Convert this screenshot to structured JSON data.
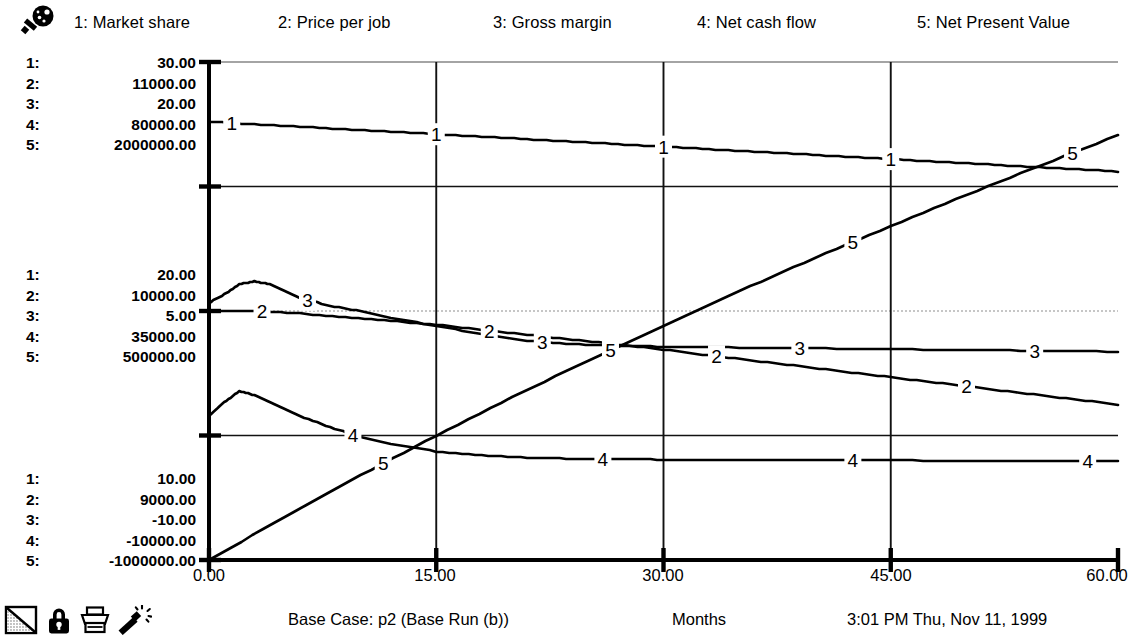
{
  "window": {
    "title": "Simulation Graph"
  },
  "toolbar": {
    "zoom_icon": "magnifier-icon"
  },
  "legend": {
    "entries": [
      {
        "index": "1",
        "label": "1: Market share"
      },
      {
        "index": "2",
        "label": "2: Price per job"
      },
      {
        "index": "3",
        "label": "3: Gross margin"
      },
      {
        "index": "4",
        "label": "4: Net cash flow"
      },
      {
        "index": "5",
        "label": "5: Net Present Value"
      }
    ]
  },
  "y_scales": {
    "top": [
      {
        "idx": "1:",
        "value": "30.00"
      },
      {
        "idx": "2:",
        "value": "11000.00"
      },
      {
        "idx": "3:",
        "value": "20.00"
      },
      {
        "idx": "4:",
        "value": "80000.00"
      },
      {
        "idx": "5:",
        "value": "2000000.00"
      }
    ],
    "middle": [
      {
        "idx": "1:",
        "value": "20.00"
      },
      {
        "idx": "2:",
        "value": "10000.00"
      },
      {
        "idx": "3:",
        "value": "5.00"
      },
      {
        "idx": "4:",
        "value": "35000.00"
      },
      {
        "idx": "5:",
        "value": "500000.00"
      }
    ],
    "bottom": [
      {
        "idx": "1:",
        "value": "10.00"
      },
      {
        "idx": "2:",
        "value": "9000.00"
      },
      {
        "idx": "3:",
        "value": "-10.00"
      },
      {
        "idx": "4:",
        "value": "-10000.00"
      },
      {
        "idx": "5:",
        "value": "-1000000.00"
      }
    ]
  },
  "x_axis": {
    "ticks": [
      "0.00",
      "15.00",
      "30.00",
      "45.00",
      "60.00"
    ],
    "title": "Months"
  },
  "footer": {
    "run_label": "Base Case: p2 (Base Run (b))",
    "x_title": "Months",
    "timestamp": "3:01 PM   Thu, Nov 11, 1999",
    "icons": [
      "page-corner-icon",
      "lock-icon",
      "printer-icon",
      "magic-wand-icon"
    ]
  },
  "chart_data": {
    "type": "line",
    "title": "",
    "subtitle": "Base Case: p2 (Base Run (b))",
    "xlabel": "Months",
    "ylabel": "",
    "xlim": [
      0,
      60
    ],
    "xticks": [
      0,
      15,
      30,
      45,
      60
    ],
    "grid": true,
    "grid_vertical_at": [
      15,
      30,
      45
    ],
    "grid_horizontal_at_fraction": [
      1.0,
      0.75,
      0.5,
      0.25,
      0.0
    ],
    "legend_position": "top",
    "note": "Five series, each drawn on its own independent y-scale. Scale max / mid / min values per series are given below; y values are in each series' own units.",
    "series": [
      {
        "name": "Market share",
        "index": 1,
        "scale": {
          "max": 30.0,
          "mid": 20.0,
          "min": 10.0
        },
        "units": "%",
        "label_marker_x": [
          1.5,
          15.0,
          30.0,
          45.0
        ],
        "x": [
          0,
          3,
          6,
          9,
          12,
          15,
          18,
          21,
          24,
          27,
          30,
          33,
          36,
          39,
          42,
          45,
          48,
          51,
          54,
          57,
          60
        ],
        "y": [
          27.6,
          27.5,
          27.4,
          27.3,
          27.2,
          27.1,
          27.0,
          26.9,
          26.8,
          26.7,
          26.6,
          26.5,
          26.4,
          26.3,
          26.2,
          26.1,
          26.0,
          25.9,
          25.8,
          25.7,
          25.6
        ]
      },
      {
        "name": "Price per job",
        "index": 2,
        "scale": {
          "max": 11000.0,
          "mid": 10000.0,
          "min": 9000.0
        },
        "units": "$",
        "label_marker_x": [
          3.5,
          18.5,
          33.5,
          50.0
        ],
        "x": [
          0,
          3,
          6,
          9,
          12,
          15,
          18,
          21,
          24,
          27,
          30,
          33,
          36,
          39,
          42,
          45,
          48,
          51,
          54,
          57,
          60
        ],
        "y": [
          10000,
          10000,
          9990,
          9975,
          9960,
          9945,
          9925,
          9905,
          9885,
          9865,
          9845,
          9822,
          9800,
          9778,
          9756,
          9734,
          9712,
          9690,
          9668,
          9646,
          9624
        ]
      },
      {
        "name": "Gross margin",
        "index": 3,
        "scale": {
          "max": 20.0,
          "mid": 5.0,
          "min": -10.0
        },
        "units": "%",
        "label_marker_x": [
          6.5,
          22.0,
          39.0,
          54.5
        ],
        "x": [
          0,
          1,
          2,
          3,
          4,
          5,
          6,
          8,
          10,
          12,
          15,
          18,
          21,
          24,
          27,
          30,
          35,
          40,
          45,
          50,
          55,
          60
        ],
        "y": [
          5.5,
          6.0,
          6.6,
          6.8,
          6.6,
          6.2,
          5.8,
          5.3,
          5.0,
          4.6,
          4.1,
          3.6,
          3.2,
          3.0,
          2.9,
          2.85,
          2.8,
          2.75,
          2.7,
          2.65,
          2.6,
          2.55
        ]
      },
      {
        "name": "Net cash flow",
        "index": 4,
        "scale": {
          "max": 80000.0,
          "mid": 35000.0,
          "min": -10000.0
        },
        "units": "$/month",
        "label_marker_x": [
          9.5,
          26.0,
          42.5,
          58.0
        ],
        "x": [
          0,
          1,
          2,
          3,
          4,
          5,
          6,
          8,
          10,
          12,
          15,
          18,
          21,
          24,
          27,
          30,
          35,
          40,
          45,
          50,
          55,
          60
        ],
        "y": [
          16000,
          18500,
          20500,
          19800,
          18500,
          17200,
          16000,
          14000,
          12200,
          11000,
          9600,
          8900,
          8500,
          8300,
          8200,
          8150,
          8100,
          8050,
          8000,
          7950,
          7900,
          7850
        ]
      },
      {
        "name": "Net Present Value",
        "index": 5,
        "scale": {
          "max": 2000000.0,
          "mid": 500000.0,
          "min": -1000000.0
        },
        "units": "$",
        "label_marker_x": [
          11.5,
          26.5,
          42.5,
          57.0
        ],
        "x": [
          0,
          5,
          10,
          15,
          20,
          25,
          30,
          35,
          40,
          45,
          50,
          55,
          60
        ],
        "y": [
          -1000000,
          -740000,
          -490000,
          -250000,
          -20000,
          200000,
          410000,
          620000,
          820000,
          1010000,
          1200000,
          1380000,
          1560000
        ]
      }
    ]
  }
}
